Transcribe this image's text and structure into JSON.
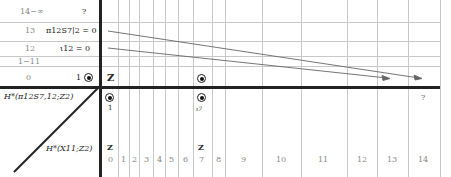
{
  "diagram": {
    "corner_labels": {
      "top": "H*(π12S7,12;Z2)",
      "bottom": "H*(X11;Z2)"
    },
    "rows": [
      {
        "degree": "14−∞",
        "entry": "?"
      },
      {
        "degree": "13",
        "entry": "π12S7|2 = 0"
      },
      {
        "degree": "12",
        "entry": "ι12 = 0"
      },
      {
        "degree": "1−11",
        "entry": ""
      },
      {
        "degree": "0",
        "entry": "1"
      }
    ],
    "columns": [
      "0",
      "1",
      "2",
      "3",
      "4",
      "5",
      "6",
      "7",
      "8",
      "9",
      "10",
      "11",
      "12",
      "13",
      "14"
    ],
    "top_row_generators": [
      {
        "column": "0",
        "label": "Z"
      },
      {
        "column": "7",
        "label": "●"
      }
    ],
    "lower_generators": [
      {
        "column": "0",
        "label": "1"
      },
      {
        "column": "7",
        "label": "ι7"
      },
      {
        "column": "14",
        "label": "?"
      }
    ],
    "bottom_row_generators": [
      {
        "column": "0",
        "label": "Z"
      },
      {
        "column": "7",
        "label": "Z"
      }
    ],
    "differentials": [
      {
        "from_row": "13",
        "to_column": "14",
        "label": "d14"
      },
      {
        "from_row": "12",
        "to_column": "13",
        "label": "d13"
      }
    ],
    "colors": {
      "axis": "#222222",
      "grid": "#c8c8c8",
      "muted_text": "#888888"
    }
  }
}
